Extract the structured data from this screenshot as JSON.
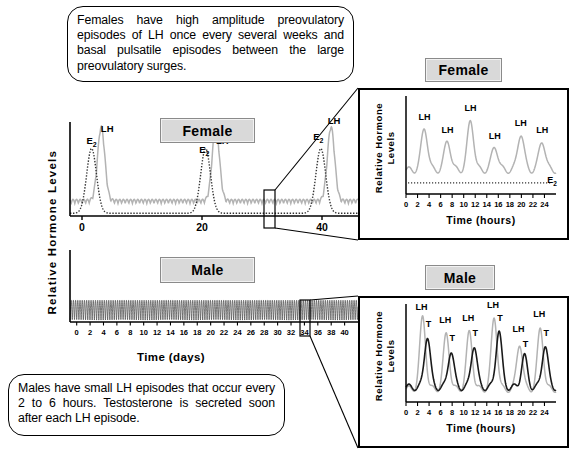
{
  "callouts": {
    "top": "Females have high amplitude preovulatory episodes of LH once every several weeks and basal pulsatile episodes between the large preovulatory surges.",
    "bottom": "Males have small LH episodes that occur every 2 to 6 hours.  Testosterone is secreted soon after each LH episode."
  },
  "tags": {
    "female_main": "Female",
    "male_main": "Male",
    "female_inset": "Female",
    "male_inset": "Male"
  },
  "axes": {
    "y_main": "Relative Hormone Levels",
    "y_inset_line1": "Relative Hormone",
    "y_inset_line2": "Levels",
    "x_days": "Time (days)",
    "x_hours": "Time (hours)"
  },
  "annotations": {
    "lh": "LH",
    "t": "T",
    "e2": "E",
    "e2_sub": "2"
  },
  "colors": {
    "lh_trace": "#b3b3b3",
    "t_trace": "#1a1a1a",
    "e2_trace": "#333333",
    "axis": "#000000",
    "tagbox_fill": "#d9d9d9",
    "tagbox_border": "#8a8a8a"
  },
  "chart_data": [
    {
      "id": "female-main",
      "type": "line",
      "title": "Female",
      "xlabel": "",
      "ylabel": "Relative Hormone Levels",
      "xlim": [
        -2,
        46
      ],
      "ylim": [
        0,
        1
      ],
      "xticks": [
        0,
        20,
        40
      ],
      "xtick_labels": [
        "0",
        "20",
        "40"
      ],
      "grid": false,
      "series": [
        {
          "name": "LH",
          "color": "#b3b3b3",
          "style": "solid",
          "peaks_x": [
            3.2,
            22.3,
            41.5
          ],
          "peak_height": 0.82,
          "basal": 0.14,
          "pulse_interval": 0.6,
          "pulse_amp": 0.05
        },
        {
          "name": "E2",
          "color": "#333333",
          "style": "dotted",
          "peaks_x": [
            1.6,
            20.6,
            39.8
          ],
          "peak_height": 0.72,
          "basal": 0.03
        }
      ],
      "labels": [
        {
          "text": "E",
          "sub": "2",
          "x": 1.6,
          "y": 0.8
        },
        {
          "text": "LH",
          "x": 4.2,
          "y": 0.93
        },
        {
          "text": "E",
          "sub": "2",
          "x": 20.4,
          "y": 0.7
        },
        {
          "text": "LH",
          "x": 23.4,
          "y": 0.8
        },
        {
          "text": "E",
          "sub": "2",
          "x": 39.4,
          "y": 0.84
        },
        {
          "text": "LH",
          "x": 42.0,
          "y": 1.02
        }
      ]
    },
    {
      "id": "male-main",
      "type": "line",
      "title": "Male",
      "xlabel": "Time (days)",
      "ylabel": "Relative Hormone Levels",
      "xlim": [
        -1,
        42
      ],
      "ylim": [
        0,
        1
      ],
      "xticks": [
        0,
        2,
        4,
        6,
        8,
        10,
        12,
        14,
        16,
        18,
        20,
        22,
        24,
        26,
        28,
        30,
        32,
        34,
        36,
        38,
        40
      ],
      "xtick_labels": [
        "0",
        "2",
        "4",
        "6",
        "8",
        "10",
        "12",
        "14",
        "16",
        "18",
        "20",
        "22",
        "24",
        "26",
        "28",
        "30",
        "32",
        "34",
        "36",
        "38",
        "40"
      ],
      "grid": false,
      "series": [
        {
          "name": "LH",
          "color": "#555555",
          "style": "solid",
          "pulse_interval": 0.33,
          "pulse_amp": 0.62,
          "basal": 0.06
        }
      ],
      "labels": []
    },
    {
      "id": "female-inset",
      "type": "line",
      "title": "Female",
      "xlabel": "Time (hours)",
      "ylabel": "Relative Hormone Levels",
      "xlim": [
        0,
        26
      ],
      "ylim": [
        0,
        1
      ],
      "xticks": [
        0,
        2,
        4,
        6,
        8,
        10,
        12,
        14,
        16,
        18,
        20,
        22,
        24
      ],
      "xtick_labels": [
        "0",
        "2",
        "4",
        "6",
        "8",
        "10",
        "12",
        "14",
        "16",
        "18",
        "20",
        "22",
        "24"
      ],
      "grid": false,
      "series": [
        {
          "name": "LH",
          "color": "#b3b3b3",
          "style": "solid",
          "peaks_x": [
            3.2,
            7.2,
            11.2,
            15.4,
            19.9,
            23.6
          ],
          "peaks_y": [
            0.72,
            0.58,
            0.8,
            0.52,
            0.66,
            0.58
          ],
          "basal": 0.26
        },
        {
          "name": "E2",
          "color": "#333333",
          "style": "dotted",
          "level": 0.12
        }
      ],
      "labels": [
        {
          "text": "LH",
          "x": 3.2,
          "y": 0.8
        },
        {
          "text": "LH",
          "x": 7.2,
          "y": 0.66
        },
        {
          "text": "LH",
          "x": 11.2,
          "y": 0.9
        },
        {
          "text": "LH",
          "x": 15.4,
          "y": 0.6
        },
        {
          "text": "LH",
          "x": 19.9,
          "y": 0.74
        },
        {
          "text": "LH",
          "x": 23.6,
          "y": 0.66
        },
        {
          "text": "E",
          "sub": "2",
          "x": 25.3,
          "y": 0.12
        }
      ]
    },
    {
      "id": "male-inset",
      "type": "line",
      "title": "Male",
      "xlabel": "Time (hours)",
      "ylabel": "Relative Hormone Levels",
      "xlim": [
        0,
        26
      ],
      "ylim": [
        0,
        1
      ],
      "xticks": [
        0,
        2,
        4,
        6,
        8,
        10,
        12,
        14,
        16,
        18,
        20,
        22,
        24
      ],
      "xtick_labels": [
        "0",
        "2",
        "4",
        "6",
        "8",
        "10",
        "12",
        "14",
        "16",
        "18",
        "20",
        "22",
        "24"
      ],
      "grid": false,
      "series": [
        {
          "name": "LH",
          "color": "#b3b3b3",
          "style": "solid",
          "peaks_x": [
            2.9,
            7.0,
            11.0,
            15.3,
            19.7,
            23.3
          ],
          "peaks_y": [
            0.92,
            0.74,
            0.76,
            0.92,
            0.64,
            0.8
          ],
          "basal": 0.14
        },
        {
          "name": "T",
          "color": "#1a1a1a",
          "style": "solid",
          "peaks_x": [
            3.7,
            7.8,
            11.8,
            16.1,
            20.5,
            24.1
          ],
          "peaks_y": [
            0.72,
            0.56,
            0.62,
            0.78,
            0.5,
            0.62
          ],
          "basal": 0.16
        }
      ],
      "labels": [
        {
          "text": "LH",
          "x": 2.7,
          "y": 1.0
        },
        {
          "text": "T",
          "x": 3.9,
          "y": 0.82
        },
        {
          "text": "LH",
          "x": 6.8,
          "y": 0.86
        },
        {
          "text": "T",
          "x": 8.0,
          "y": 0.66
        },
        {
          "text": "LH",
          "x": 10.8,
          "y": 0.88
        },
        {
          "text": "T",
          "x": 12.0,
          "y": 0.72
        },
        {
          "text": "LH",
          "x": 15.1,
          "y": 1.02
        },
        {
          "text": "T",
          "x": 16.3,
          "y": 0.88
        },
        {
          "text": "LH",
          "x": 19.5,
          "y": 0.76
        },
        {
          "text": "T",
          "x": 20.7,
          "y": 0.6
        },
        {
          "text": "LH",
          "x": 23.1,
          "y": 0.92
        },
        {
          "text": "T",
          "x": 24.3,
          "y": 0.72
        }
      ]
    }
  ]
}
